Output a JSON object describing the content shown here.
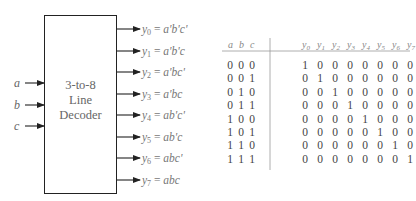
{
  "decoder": {
    "title_line1": "3-to-8",
    "title_line2": "Line",
    "title_line3": "Decoder",
    "inputs": [
      "a",
      "b",
      "c"
    ],
    "outputs": [
      {
        "name": "y",
        "sub": "0",
        "expr": "a'b'c'"
      },
      {
        "name": "y",
        "sub": "1",
        "expr": "a'b'c"
      },
      {
        "name": "y",
        "sub": "2",
        "expr": "a'bc'"
      },
      {
        "name": "y",
        "sub": "3",
        "expr": "a'bc"
      },
      {
        "name": "y",
        "sub": "4",
        "expr": "ab'c'"
      },
      {
        "name": "y",
        "sub": "5",
        "expr": "ab'c"
      },
      {
        "name": "y",
        "sub": "6",
        "expr": "abc'"
      },
      {
        "name": "y",
        "sub": "7",
        "expr": "abc"
      }
    ]
  },
  "truth_table": {
    "input_headers": [
      "a",
      "b",
      "c"
    ],
    "output_headers": [
      {
        "name": "y",
        "sub": "0"
      },
      {
        "name": "y",
        "sub": "1"
      },
      {
        "name": "y",
        "sub": "2"
      },
      {
        "name": "y",
        "sub": "3"
      },
      {
        "name": "y",
        "sub": "4"
      },
      {
        "name": "y",
        "sub": "5"
      },
      {
        "name": "y",
        "sub": "6"
      },
      {
        "name": "y",
        "sub": "7"
      }
    ],
    "rows": [
      {
        "inputs": [
          "0",
          "0",
          "0"
        ],
        "outputs": [
          "1",
          "0",
          "0",
          "0",
          "0",
          "0",
          "0",
          "0"
        ]
      },
      {
        "inputs": [
          "0",
          "0",
          "1"
        ],
        "outputs": [
          "0",
          "1",
          "0",
          "0",
          "0",
          "0",
          "0",
          "0"
        ]
      },
      {
        "inputs": [
          "0",
          "1",
          "0"
        ],
        "outputs": [
          "0",
          "0",
          "1",
          "0",
          "0",
          "0",
          "0",
          "0"
        ]
      },
      {
        "inputs": [
          "0",
          "1",
          "1"
        ],
        "outputs": [
          "0",
          "0",
          "0",
          "1",
          "0",
          "0",
          "0",
          "0"
        ]
      },
      {
        "inputs": [
          "1",
          "0",
          "0"
        ],
        "outputs": [
          "0",
          "0",
          "0",
          "0",
          "1",
          "0",
          "0",
          "0"
        ]
      },
      {
        "inputs": [
          "1",
          "0",
          "1"
        ],
        "outputs": [
          "0",
          "0",
          "0",
          "0",
          "0",
          "1",
          "0",
          "0"
        ]
      },
      {
        "inputs": [
          "1",
          "1",
          "0"
        ],
        "outputs": [
          "0",
          "0",
          "0",
          "0",
          "0",
          "0",
          "1",
          "0"
        ]
      },
      {
        "inputs": [
          "1",
          "1",
          "1"
        ],
        "outputs": [
          "0",
          "0",
          "0",
          "0",
          "0",
          "0",
          "0",
          "1"
        ]
      }
    ]
  }
}
